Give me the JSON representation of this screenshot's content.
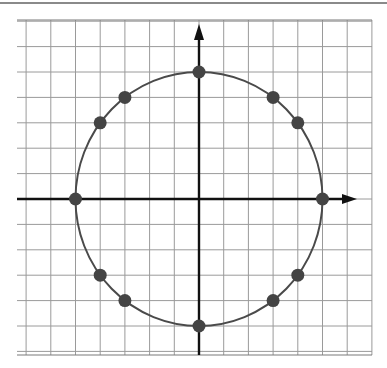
{
  "figure": {
    "title": ""
  },
  "grid": {
    "x_min": -7,
    "x_max": 7,
    "y_min": -6,
    "y_max": 7,
    "cell_px_x": 24.7,
    "cell_px_y": 25.4,
    "origin_px": [
      199,
      199
    ],
    "left_px": 17,
    "right_px": 372,
    "top_px": 20,
    "bottom_px": 355,
    "line_color": "#9a9a9a",
    "border_color": "#7a7a7a"
  },
  "axes": {
    "color": "#111111",
    "x_arrow": true,
    "y_arrow": true,
    "x_label": "",
    "y_label": ""
  },
  "circle": {
    "center": [
      0,
      0
    ],
    "radius": 5,
    "stroke": "#4a4a4a"
  },
  "points": {
    "color": "#444444",
    "radius_px": 6.5,
    "coords": [
      [
        0,
        5
      ],
      [
        3,
        4
      ],
      [
        4,
        3
      ],
      [
        5,
        0
      ],
      [
        4,
        -3
      ],
      [
        3,
        -4
      ],
      [
        0,
        -5
      ],
      [
        -3,
        -4
      ],
      [
        -4,
        -3
      ],
      [
        -5,
        0
      ],
      [
        -4,
        3
      ],
      [
        -3,
        4
      ]
    ]
  },
  "colors": {
    "background": "#ffffff",
    "top_rule": "#8a8a8a"
  }
}
